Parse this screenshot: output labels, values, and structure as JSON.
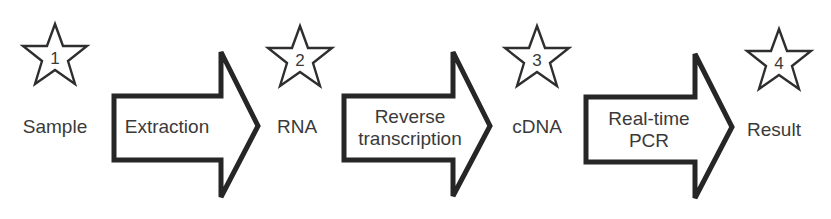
{
  "diagram": {
    "type": "process-flow",
    "colors": {
      "stroke": "#262626",
      "text": "#3a3a3a",
      "background": "#ffffff"
    },
    "nodes": [
      {
        "number": "1",
        "label": "Sample"
      },
      {
        "number": "2",
        "label": "RNA"
      },
      {
        "number": "3",
        "label": "cDNA"
      },
      {
        "number": "4",
        "label": "Result"
      }
    ],
    "steps": [
      {
        "lines": [
          "Extraction"
        ]
      },
      {
        "lines": [
          "Reverse",
          "transcription"
        ]
      },
      {
        "lines": [
          "Real-time",
          "PCR"
        ]
      }
    ]
  }
}
